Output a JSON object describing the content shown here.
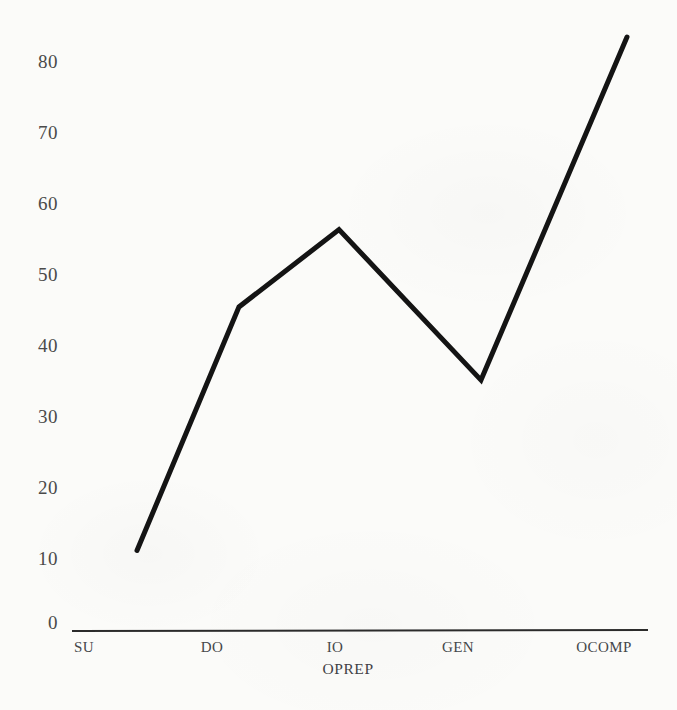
{
  "chart_data": {
    "type": "line",
    "title": "",
    "subtitle": "",
    "xlabel": "OPREP",
    "ylabel": "",
    "categories": [
      "SU",
      "DO",
      "IO",
      "GEN",
      "OCOMP"
    ],
    "values": [
      11.2,
      45.5,
      56.4,
      35.2,
      83.5
    ],
    "series": [
      {
        "name": "",
        "values": [
          11.2,
          45.5,
          56.4,
          35.2,
          83.5
        ]
      }
    ],
    "ylim": [
      0,
      80
    ],
    "yticks": [
      0,
      10,
      20,
      30,
      40,
      50,
      60,
      70,
      80
    ],
    "ytick_labels": [
      "0",
      "10",
      "20",
      "30",
      "40",
      "50",
      "60",
      "70",
      "80"
    ],
    "xtick_labels": [
      "SU",
      "DO",
      "IO",
      "GEN",
      "OCOMP"
    ],
    "grid": false,
    "legend": false,
    "legend_position": "none",
    "line_color": "#141414",
    "line_width": 5,
    "axis_color": "#2b2b2b",
    "background_color": "#fbfbf9",
    "text_color": "#45474a",
    "annotations": []
  },
  "geometry": {
    "plot_left": 72,
    "plot_right": 648,
    "baseline_y": 630,
    "unit_px": 7.1,
    "point_x": [
      137,
      239,
      339,
      481,
      627
    ],
    "ytick_y": [
      624,
      553,
      482,
      411,
      340,
      269,
      198,
      127,
      56
    ],
    "xtick_x": [
      84,
      212,
      335,
      458,
      604
    ],
    "xtitle_x": 348,
    "xtitle_y": 661,
    "xtick_y": 640
  }
}
